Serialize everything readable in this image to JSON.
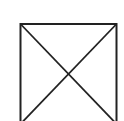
{
  "diagram": {
    "shape": "square-with-diagonals",
    "stroke_color": "#222222",
    "background": "#ffffff",
    "box": {
      "x": 20.5,
      "y": 24,
      "width": 96,
      "height": 100
    }
  }
}
